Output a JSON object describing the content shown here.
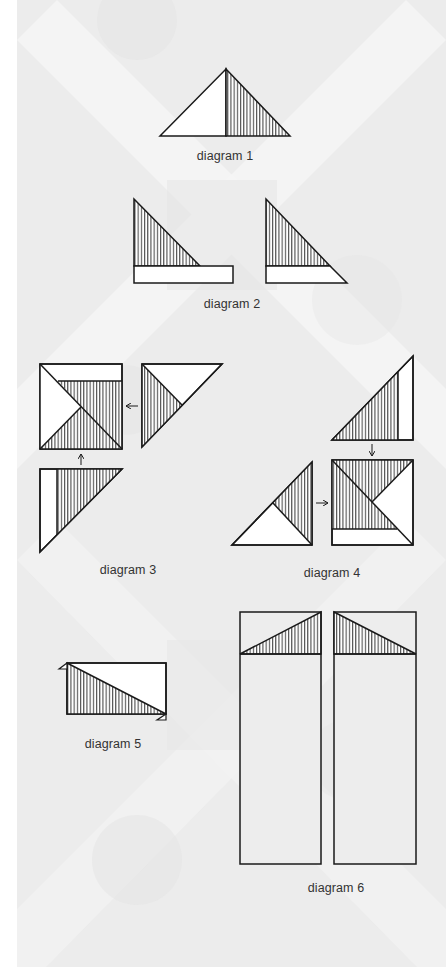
{
  "page": {
    "background": {
      "strip_color": "#ffffff",
      "pattern_base": "#ededed",
      "pattern_light": "#f7f7f7",
      "pattern_dark": "#e2e2e2"
    },
    "colors": {
      "stroke": "#1a1a1a",
      "hatch": "#222222",
      "fill_white": "#ffffff"
    }
  },
  "diagrams": [
    {
      "id": 1,
      "caption": "diagram 1"
    },
    {
      "id": 2,
      "caption": "diagram 2"
    },
    {
      "id": 3,
      "caption": "diagram 3"
    },
    {
      "id": 4,
      "caption": "diagram 4"
    },
    {
      "id": 5,
      "caption": "diagram 5"
    },
    {
      "id": 6,
      "caption": "diagram 6"
    }
  ]
}
